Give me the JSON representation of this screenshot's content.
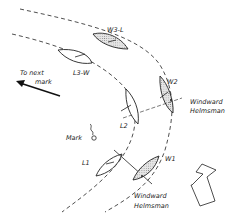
{
  "diagram": {
    "boats": {
      "w3l": {
        "label": "W3-L",
        "role": "windward"
      },
      "l3w": {
        "label": "L3-W",
        "role": "leeward"
      },
      "w2": {
        "label": "W2",
        "role": "windward"
      },
      "l2": {
        "label": "L2",
        "role": "leeward"
      },
      "w1": {
        "label": "W1",
        "role": "windward"
      },
      "l1": {
        "label": "L1",
        "role": "leeward"
      }
    },
    "labels": {
      "to_next_1": "To next",
      "to_next_2": "mark",
      "mark": "Mark",
      "windward_1a": "Windward",
      "windward_1b": "Helmsman",
      "windward_2a": "Windward",
      "windward_2b": "Helmsman"
    },
    "icons": {
      "wind_arrow": "wind-direction-arrow",
      "next_mark_arrow": "arrow-left-icon",
      "mark_buoy": "buoy-icon"
    },
    "colors": {
      "ink": "#222222",
      "background": "#ffffff",
      "stipple": "#999999"
    }
  }
}
